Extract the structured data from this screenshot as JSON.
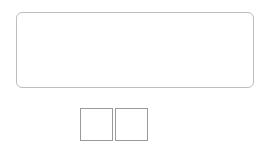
{
  "figure": {
    "top_row": {
      "count": 7,
      "color": "#4f4f4f",
      "highlight": "#8a8a8a"
    },
    "bottom_row": {
      "count": 5,
      "color": "#8c8c8c",
      "highlight": "#c4c4c4"
    },
    "connected_pairs": 5,
    "ball_x": [
      47,
      76,
      105,
      134,
      163,
      192,
      221
    ],
    "top_y": 31,
    "bottom_y": 70,
    "radius": 7
  },
  "equation": {
    "minuend": "7",
    "minus": "−",
    "equals": "=",
    "blank1": "",
    "blank2": ""
  }
}
